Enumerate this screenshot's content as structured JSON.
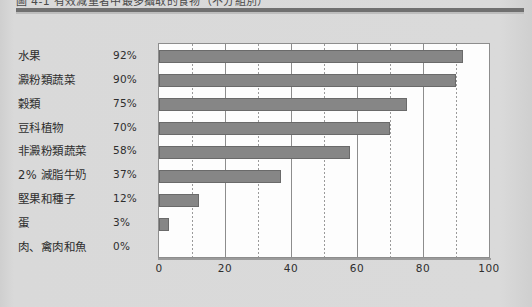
{
  "page": {
    "caption_clipped": "圖 4-1 有效減重者中最多攝取的食物（不分組別）"
  },
  "chart_data": {
    "type": "bar",
    "orientation": "horizontal",
    "title": "",
    "xlabel": "",
    "ylabel": "",
    "xlim": [
      0,
      100
    ],
    "xticks": [
      "0",
      "20",
      "40",
      "60",
      "80",
      "100"
    ],
    "xtick_values": [
      0,
      20,
      40,
      60,
      80,
      100
    ],
    "minor_gridlines": [
      10,
      30,
      50,
      70,
      90
    ],
    "grid": true,
    "legend": "none",
    "bar_color": "#868686",
    "bar_edge_color": "#6a6a6a",
    "plot_background": "#fdfdfd",
    "page_background": "#d7d7d7",
    "categories": [
      "水果",
      "澱粉類蔬菜",
      "穀類",
      "豆科植物",
      "非澱粉類蔬菜",
      "2% 減脂牛奶",
      "堅果和種子",
      "蛋",
      "肉、禽肉和魚"
    ],
    "values": [
      92,
      90,
      75,
      70,
      58,
      37,
      12,
      3,
      0
    ],
    "value_labels": [
      "92%",
      "90%",
      "75%",
      "70%",
      "58%",
      "37%",
      "12%",
      "3%",
      "0%"
    ]
  }
}
